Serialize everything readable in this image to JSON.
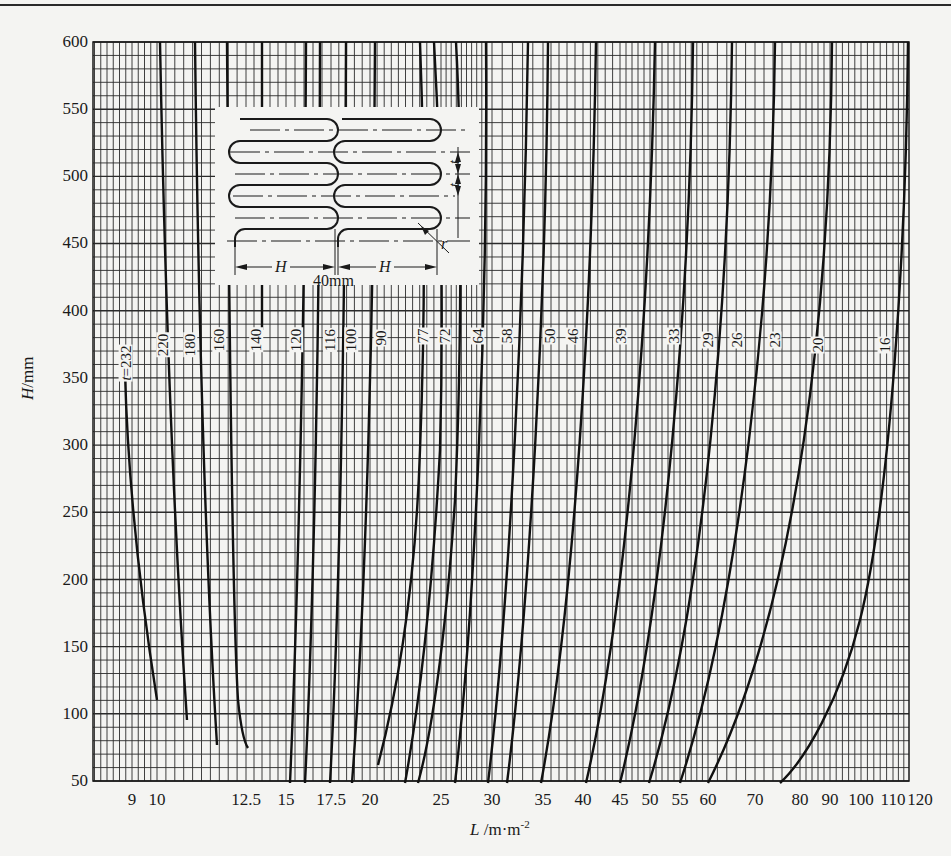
{
  "chart_data": {
    "type": "line",
    "title": "",
    "xlabel": "L /m·m⁻²",
    "ylabel": "H/mm",
    "xscale": "nonlinear (nomogram)",
    "ylim": [
      50,
      600
    ],
    "yticks": [
      50,
      100,
      150,
      200,
      250,
      300,
      350,
      400,
      450,
      500,
      550,
      600
    ],
    "xticks": [
      "9",
      "10",
      "12.5",
      "15",
      "17.5",
      "20",
      "25",
      "30",
      "35",
      "40",
      "45",
      "50",
      "55",
      "60",
      "70",
      "80",
      "90",
      "100",
      "110",
      "120"
    ],
    "grid": true,
    "legend": "none (curves labeled inline with pitch t values)",
    "curve_label_prefix": "t=",
    "series": [
      {
        "name": "t=232",
        "points": [
          [
            9.8,
            370
          ],
          [
            9.9,
            300
          ],
          [
            10.0,
            200
          ],
          [
            10.1,
            120
          ]
        ]
      },
      {
        "name": "220",
        "points": [
          [
            10.5,
            600
          ],
          [
            10.8,
            400
          ],
          [
            11.3,
            200
          ],
          [
            11.6,
            105
          ]
        ]
      },
      {
        "name": "180",
        "points": [
          [
            11.2,
            600
          ],
          [
            11.5,
            400
          ],
          [
            12.0,
            200
          ],
          [
            12.4,
            85
          ]
        ]
      },
      {
        "name": "160",
        "points": [
          [
            12.2,
            600
          ],
          [
            12.3,
            400
          ],
          [
            12.6,
            200
          ],
          [
            13.0,
            120
          ],
          [
            13.6,
            80
          ]
        ]
      },
      {
        "name": "140",
        "points": [
          [
            14.5,
            600
          ],
          [
            14.5,
            400
          ]
        ]
      },
      {
        "name": "120",
        "points": [
          [
            16.8,
            600
          ],
          [
            16.5,
            400
          ],
          [
            16.0,
            200
          ],
          [
            15.2,
            50
          ]
        ]
      },
      {
        "name": "116",
        "points": [
          [
            17.0,
            600
          ],
          [
            17.0,
            400
          ],
          [
            16.6,
            200
          ],
          [
            16.0,
            50
          ]
        ]
      },
      {
        "name": "100",
        "points": [
          [
            19.5,
            600
          ],
          [
            19.2,
            400
          ],
          [
            18.5,
            200
          ],
          [
            17.5,
            50
          ]
        ]
      },
      {
        "name": "90",
        "points": [
          [
            21.0,
            600
          ],
          [
            20.8,
            400
          ],
          [
            20.0,
            200
          ],
          [
            19.0,
            50
          ]
        ]
      },
      {
        "name": "77",
        "points": [
          [
            24.5,
            600
          ],
          [
            24.5,
            400
          ],
          [
            23.0,
            200
          ],
          [
            20.5,
            60
          ]
        ]
      },
      {
        "name": "72",
        "points": [
          [
            25.8,
            600
          ],
          [
            25.5,
            400
          ],
          [
            24.5,
            200
          ],
          [
            22.5,
            50
          ]
        ]
      },
      {
        "name": "64",
        "points": [
          [
            28.5,
            600
          ],
          [
            28.5,
            400
          ],
          [
            27.0,
            200
          ],
          [
            24.0,
            50
          ]
        ]
      },
      {
        "name": "58",
        "points": [
          [
            32.0,
            600
          ],
          [
            31.0,
            400
          ],
          [
            29.0,
            200
          ],
          [
            26.0,
            50
          ]
        ]
      },
      {
        "name": "50",
        "points": [
          [
            37.0,
            600
          ],
          [
            35.5,
            400
          ],
          [
            32.5,
            200
          ],
          [
            29.5,
            50
          ]
        ]
      },
      {
        "name": "46",
        "points": [
          [
            39.5,
            600
          ],
          [
            38.0,
            400
          ],
          [
            34.5,
            200
          ],
          [
            31.0,
            50
          ]
        ]
      },
      {
        "name": "39",
        "points": [
          [
            46.0,
            600
          ],
          [
            44.0,
            400
          ],
          [
            39.0,
            200
          ],
          [
            35.0,
            50
          ]
        ]
      },
      {
        "name": "33",
        "points": [
          [
            55.0,
            600
          ],
          [
            52.0,
            400
          ],
          [
            46.0,
            200
          ],
          [
            40.5,
            50
          ]
        ]
      },
      {
        "name": "29",
        "points": [
          [
            60.0,
            600
          ],
          [
            58.0,
            400
          ],
          [
            52.0,
            200
          ],
          [
            45.0,
            50
          ]
        ]
      },
      {
        "name": "26",
        "points": [
          [
            67.0,
            600
          ],
          [
            63.0,
            400
          ],
          [
            56.0,
            200
          ],
          [
            49.0,
            50
          ]
        ]
      },
      {
        "name": "23",
        "points": [
          [
            76.0,
            600
          ],
          [
            72.0,
            400
          ],
          [
            63.0,
            200
          ],
          [
            55.0,
            50
          ]
        ]
      },
      {
        "name": "20",
        "points": [
          [
            92.0,
            600
          ],
          [
            88.0,
            400
          ],
          [
            74.0,
            200
          ],
          [
            62.0,
            50
          ]
        ]
      },
      {
        "name": "16",
        "points": [
          [
            120.0,
            600
          ],
          [
            116.0,
            400
          ],
          [
            100.0,
            200
          ],
          [
            78.0,
            50
          ]
        ]
      }
    ],
    "annotations": [
      "inset diagram: serpentine tube with pitch t, bend radius r, straight length H, spacing 40mm"
    ]
  },
  "axis": {
    "y_label_italic": "H",
    "y_label_unit": "/mm",
    "x_label_italic": "L",
    "x_label_unit": " /m·m",
    "x_label_sup": "-2",
    "y_ticks": [
      {
        "label": "600",
        "y": 42
      },
      {
        "label": "550",
        "y": 109
      },
      {
        "label": "500",
        "y": 176
      },
      {
        "label": "450",
        "y": 243
      },
      {
        "label": "400",
        "y": 311
      },
      {
        "label": "350",
        "y": 378
      },
      {
        "label": "300",
        "y": 445
      },
      {
        "label": "250",
        "y": 512
      },
      {
        "label": "200",
        "y": 580
      },
      {
        "label": "150",
        "y": 647
      },
      {
        "label": "100",
        "y": 714
      },
      {
        "label": "50",
        "y": 781
      }
    ],
    "x_ticks": [
      {
        "label": "9",
        "x": 132
      },
      {
        "label": "10",
        "x": 157
      },
      {
        "label": "12.5",
        "x": 246
      },
      {
        "label": "15",
        "x": 286
      },
      {
        "label": "17.5",
        "x": 331
      },
      {
        "label": "20",
        "x": 370
      },
      {
        "label": "25",
        "x": 441
      },
      {
        "label": "30",
        "x": 492
      },
      {
        "label": "35",
        "x": 543
      },
      {
        "label": "40",
        "x": 583
      },
      {
        "label": "45",
        "x": 620
      },
      {
        "label": "50",
        "x": 650
      },
      {
        "label": "55",
        "x": 680
      },
      {
        "label": "60",
        "x": 708
      },
      {
        "label": "70",
        "x": 755
      },
      {
        "label": "80",
        "x": 800
      },
      {
        "label": "90",
        "x": 830
      },
      {
        "label": "100",
        "x": 861
      },
      {
        "label": "110",
        "x": 893
      },
      {
        "label": "120",
        "x": 920
      }
    ]
  },
  "curve_labels": [
    {
      "text": "t=232",
      "x": 121,
      "y": 363
    },
    {
      "text": "220",
      "x": 165,
      "y": 345
    },
    {
      "text": "180",
      "x": 192,
      "y": 345
    },
    {
      "text": "160",
      "x": 221,
      "y": 340
    },
    {
      "text": "140",
      "x": 258,
      "y": 340
    },
    {
      "text": "120",
      "x": 298,
      "y": 340
    },
    {
      "text": "116",
      "x": 332,
      "y": 340
    },
    {
      "text": "100",
      "x": 353,
      "y": 340
    },
    {
      "text": "90",
      "x": 386,
      "y": 338
    },
    {
      "text": "77",
      "x": 428,
      "y": 336
    },
    {
      "text": "72",
      "x": 450,
      "y": 336
    },
    {
      "text": "64",
      "x": 483,
      "y": 336
    },
    {
      "text": "58",
      "x": 512,
      "y": 336
    },
    {
      "text": "50",
      "x": 555,
      "y": 336
    },
    {
      "text": "46",
      "x": 578,
      "y": 336
    },
    {
      "text": "39",
      "x": 626,
      "y": 336
    },
    {
      "text": "33",
      "x": 679,
      "y": 336
    },
    {
      "text": "29",
      "x": 713,
      "y": 340
    },
    {
      "text": "26",
      "x": 742,
      "y": 340
    },
    {
      "text": "23",
      "x": 780,
      "y": 340
    },
    {
      "text": "20",
      "x": 823,
      "y": 345
    },
    {
      "text": "16",
      "x": 890,
      "y": 345
    }
  ],
  "curve_paths": [
    "M125,372 C127,450 135,560 157,700",
    "M160,42 C164,250 172,500 187,720",
    "M195,42 C198,300 205,550 217,745",
    "M227,42 C229,300 232,600 238,700 C241,730 244,742 248,748",
    "M262,42 L262,330",
    "M306,42 C305,300 298,600 290,783",
    "M320,42 C320,300 314,600 305,783",
    "M346,42 C345,300 340,600 330,783",
    "M375,42 C374,300 366,600 352,783",
    "M420,42 C424,150 426,300 420,450 C415,600 395,700 378,765",
    "M434,42 C440,150 444,300 440,450 C432,600 420,700 405,783",
    "M456,42 C462,150 462,350 455,500 C445,650 430,740 418,783",
    "M486,42 C488,300 476,600 455,783",
    "M528,42 C524,300 510,600 488,783",
    "M548,42 C546,300 530,600 507,783",
    "M596,42 C592,300 575,600 541,783",
    "M655,42 C650,300 628,600 586,783",
    "M693,42 C690,300 665,600 620,783",
    "M732,42 C729,300 705,600 649,783",
    "M775,42 C772,300 740,600 680,783",
    "M832,42 C830,300 800,600 708,783",
    "M908,42 C906,250 890,500 860,620 C840,700 805,760 780,783"
  ],
  "inset": {
    "label_H_left": "H",
    "label_H_right": "H",
    "label_spacing": "40mm",
    "label_t_top": "t",
    "label_t_bottom": "t",
    "label_r": "r"
  }
}
